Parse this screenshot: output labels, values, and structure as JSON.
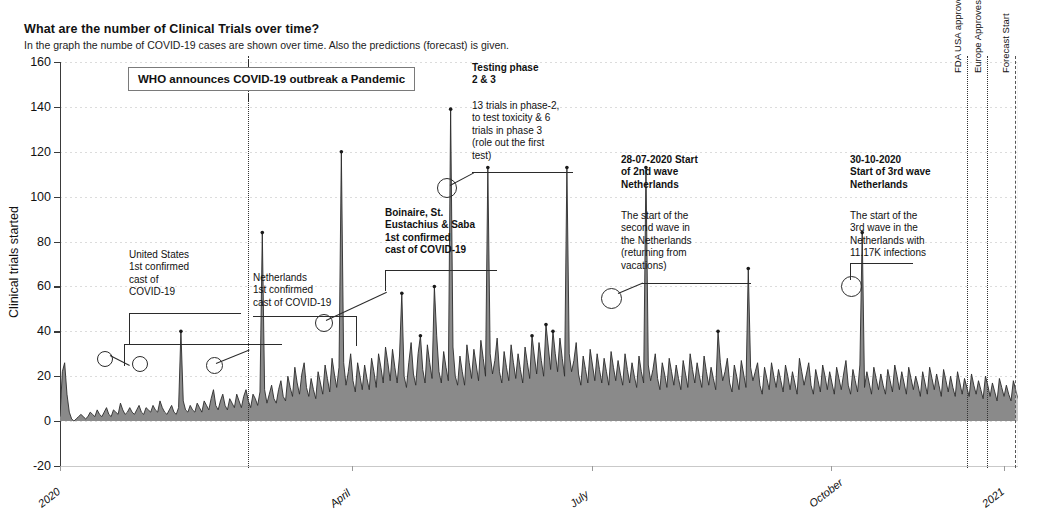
{
  "header": {
    "title": "What are the number of Clinical Trials over time?",
    "subtitle": "In the graph the numbe of COVID-19 cases are shown over time. Also the predictions (forecast) is given."
  },
  "chart_data": {
    "type": "area",
    "title": "What are the number of Clinical Trials over time?",
    "subtitle": "In the graph the numbe of COVID-19 cases are shown over time. Also the predictions (forecast) is given.",
    "xlabel": "Start date clinical trials",
    "ylabel": "Clinical trials started",
    "ylim": [
      -20,
      160
    ],
    "yticks": [
      "160",
      "140",
      "120",
      "100",
      "80",
      "60",
      "40",
      "20",
      "0",
      "-20"
    ],
    "ytick_values": [
      160,
      140,
      120,
      100,
      80,
      60,
      40,
      20,
      0,
      -20
    ],
    "xticks": [
      "2020",
      "April",
      "July",
      "October",
      "2021"
    ],
    "xtick_positions": [
      0,
      0.305,
      0.555,
      0.805,
      0.985
    ],
    "grid": true,
    "legend_position": "none",
    "series": [
      {
        "name": "Clinical trials started",
        "values": [
          2,
          22,
          26,
          12,
          4,
          1,
          0,
          1,
          2,
          3,
          2,
          1,
          2,
          4,
          3,
          2,
          5,
          3,
          2,
          4,
          6,
          3,
          2,
          5,
          4,
          3,
          8,
          5,
          3,
          4,
          6,
          4,
          3,
          5,
          7,
          4,
          3,
          6,
          5,
          4,
          7,
          5,
          4,
          9,
          6,
          4,
          3,
          5,
          7,
          4,
          3,
          6,
          40,
          9,
          5,
          4,
          7,
          5,
          4,
          8,
          6,
          4,
          9,
          7,
          5,
          10,
          14,
          7,
          5,
          9,
          12,
          7,
          5,
          10,
          8,
          6,
          12,
          9,
          6,
          11,
          14,
          9,
          6,
          12,
          10,
          7,
          13,
          84,
          14,
          8,
          12,
          16,
          10,
          8,
          14,
          18,
          11,
          9,
          20,
          15,
          11,
          24,
          17,
          12,
          21,
          26,
          15,
          11,
          19,
          14,
          10,
          22,
          17,
          12,
          25,
          19,
          13,
          28,
          21,
          15,
          24,
          120,
          26,
          16,
          22,
          30,
          18,
          13,
          26,
          20,
          14,
          25,
          19,
          14,
          28,
          22,
          15,
          30,
          24,
          17,
          33,
          26,
          18,
          32,
          24,
          17,
          29,
          57,
          20,
          15,
          26,
          35,
          21,
          16,
          30,
          38,
          23,
          17,
          34,
          26,
          19,
          60,
          38,
          22,
          17,
          31,
          24,
          18,
          139,
          33,
          20,
          16,
          29,
          22,
          16,
          34,
          26,
          19,
          32,
          25,
          18,
          36,
          28,
          20,
          113,
          30,
          21,
          27,
          37,
          22,
          17,
          31,
          24,
          18,
          34,
          26,
          19,
          30,
          23,
          17,
          33,
          26,
          19,
          38,
          29,
          21,
          35,
          27,
          20,
          43,
          33,
          23,
          40,
          30,
          22,
          37,
          28,
          20,
          113,
          30,
          22,
          27,
          35,
          21,
          16,
          29,
          23,
          17,
          32,
          25,
          18,
          30,
          23,
          17,
          28,
          22,
          16,
          31,
          24,
          18,
          27,
          21,
          16,
          30,
          23,
          17,
          26,
          20,
          15,
          29,
          22,
          17,
          113,
          25,
          18,
          23,
          30,
          19,
          14,
          26,
          21,
          15,
          28,
          22,
          16,
          25,
          19,
          14,
          27,
          21,
          15,
          30,
          23,
          17,
          26,
          20,
          15,
          29,
          22,
          16,
          24,
          19,
          14,
          40,
          26,
          18,
          22,
          28,
          17,
          13,
          25,
          20,
          14,
          27,
          21,
          15,
          68,
          24,
          18,
          22,
          26,
          16,
          12,
          24,
          19,
          14,
          26,
          20,
          15,
          23,
          18,
          13,
          25,
          20,
          14,
          22,
          17,
          12,
          28,
          22,
          16,
          21,
          26,
          16,
          12,
          23,
          18,
          13,
          25,
          20,
          14,
          22,
          17,
          12,
          24,
          19,
          14,
          21,
          27,
          16,
          12,
          23,
          18,
          13,
          25,
          84,
          15,
          22,
          17,
          12,
          24,
          19,
          14,
          21,
          16,
          12,
          23,
          18,
          13,
          25,
          20,
          14,
          22,
          17,
          12,
          24,
          19,
          14,
          20,
          16,
          11,
          22,
          17,
          12,
          24,
          19,
          14,
          21,
          16,
          11,
          23,
          18,
          13,
          20,
          15,
          11,
          22,
          17,
          12,
          19,
          15,
          11,
          21,
          16,
          12,
          18,
          14,
          10,
          20,
          16,
          11,
          17,
          13,
          9,
          19,
          15,
          11,
          16,
          12,
          9,
          18,
          14,
          10
        ]
      }
    ],
    "forecast_start_fraction": 0.9985
  },
  "event_lines": [
    {
      "id": "who-pandemic",
      "label": "",
      "style": "dotted",
      "x_fraction": 0.196
    },
    {
      "id": "fda-usa-pfizer",
      "label": "FDA USA approves Pfizer vaccine",
      "style": "dotted",
      "x_fraction": 0.947
    },
    {
      "id": "europe-pfizer",
      "label": "Europe Approves Pfizer Vaccine",
      "style": "dotted",
      "x_fraction": 0.968
    },
    {
      "id": "forecast-start",
      "label": "Forecast Start",
      "style": "dashed",
      "x_fraction": 0.997
    }
  ],
  "annotations": {
    "who_box": "WHO announces COVID-19 outbreak a Pandemic",
    "united_states": "United States\n1st confirmed\ncast of\nCOVID-19",
    "netherlands": "Netherlands\n1st confirmed\ncast of COVID-19",
    "bonaire": "Boinaire, St.\nEustachius & Saba\n1st confirmed\ncast of COVID-19",
    "testing_phase_heading": "Testing phase\n2 & 3",
    "testing_phase_body": "13 trials in phase-2,\nto test toxicity & 6\ntrials in phase 3\n(role out the first\ntest)",
    "second_wave_heading": "28-07-2020 Start\nof 2nd wave\nNetherlands",
    "second_wave_body": "The start of the\nsecond wave in\nthe Netherlands\n(returning from\nvacations)",
    "third_wave_heading": "30-10-2020\nStart of 3rd wave\nNetherlands",
    "third_wave_body": "The start of the\n3rd wave in the\nNetherlands with\n11.17K infections"
  },
  "colors": {
    "series_fill": "#8a8a8a",
    "series_line": "#2b2b2b",
    "axis": "#3a3a3a",
    "grid": "#dcdcdc",
    "text": "#111111"
  }
}
